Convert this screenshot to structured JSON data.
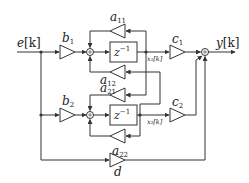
{
  "diagram": {
    "input": {
      "label": "e",
      "arg": "[k]"
    },
    "output": {
      "label": "y",
      "arg": "[k]"
    },
    "gains": {
      "b1": {
        "sym": "b",
        "sub": "1"
      },
      "b2": {
        "sym": "b",
        "sub": "2"
      },
      "a11": {
        "sym": "a",
        "sub": "11"
      },
      "a12": {
        "sym": "a",
        "sub": "12"
      },
      "a21": {
        "sym": "a",
        "sub": "21"
      },
      "a22": {
        "sym": "a",
        "sub": "22"
      },
      "c1": {
        "sym": "c",
        "sub": "1"
      },
      "c2": {
        "sym": "c",
        "sub": "2"
      },
      "d": {
        "sym": "d",
        "sub": ""
      }
    },
    "delays": [
      {
        "label": "z",
        "exp": "−1"
      },
      {
        "label": "z",
        "exp": "−1"
      }
    ],
    "states": {
      "x1": "x₁[k]",
      "x2": "x₂[k]"
    },
    "colors": {
      "line": "#333333",
      "background": "#ffffff"
    }
  }
}
